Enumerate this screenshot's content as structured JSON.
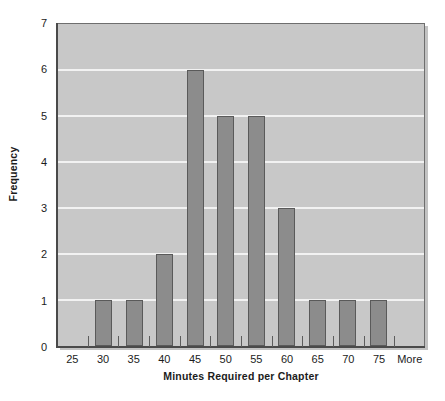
{
  "chart_data": {
    "type": "bar",
    "title": "",
    "subtitle": "",
    "xlabel": "Minutes Required per Chapter",
    "ylabel": "Frequency",
    "categories": [
      "25",
      "30",
      "35",
      "40",
      "45",
      "50",
      "55",
      "60",
      "65",
      "70",
      "75",
      "More"
    ],
    "values": [
      0,
      1,
      1,
      2,
      6,
      5,
      5,
      3,
      1,
      1,
      1,
      0
    ],
    "ylim": [
      0,
      7
    ],
    "y_ticks": [
      0,
      1,
      2,
      3,
      4,
      5,
      6,
      7
    ],
    "y_tick_labels": [
      "0",
      "1",
      "2",
      "3",
      "4",
      "5",
      "6",
      "7"
    ],
    "grid": true,
    "grid_axis": "y",
    "legend": false,
    "legend_position": "none",
    "bar_fill_color": "#8c8c8c",
    "bar_border_color": "#5a5a5a",
    "plot_background_color": "#c8c8c8",
    "gridline_color": "#f2f2f2",
    "axis_color": "#4a4a4a",
    "text_color": "#1c1c1c",
    "figure_background_color": "#ffffff"
  },
  "axes": {
    "y_title": "Frequency",
    "x_title": "Minutes Required per Chapter"
  }
}
